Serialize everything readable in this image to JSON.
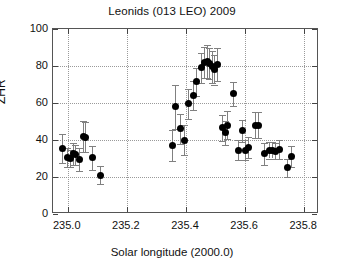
{
  "chart_data": {
    "type": "scatter",
    "title": "Leonids (013 LEO) 2009",
    "xlabel": "Solar longitude (2000.0)",
    "ylabel": "ZHR",
    "xlim": [
      234.95,
      235.85
    ],
    "ylim": [
      0,
      100
    ],
    "xticks": [
      "235.0",
      "235.2",
      "235.4",
      "235.6",
      "235.8"
    ],
    "xtick_values": [
      235.0,
      235.2,
      235.4,
      235.6,
      235.8
    ],
    "yticks": [
      "0",
      "20",
      "40",
      "60",
      "80",
      "100"
    ],
    "ytick_values": [
      0,
      20,
      40,
      60,
      80,
      100
    ],
    "grid": "dotted",
    "legend": "none",
    "series": [
      {
        "name": "ZHR observations",
        "marker": "filled-circle",
        "marker_color": "#000000",
        "errorbar_color": "#808080",
        "points": [
          {
            "x": 234.982,
            "y": 35.5,
            "yerr": 8.0
          },
          {
            "x": 235.0,
            "y": 30.5,
            "yerr": 5.0
          },
          {
            "x": 235.008,
            "y": 30.0,
            "yerr": 4.5
          },
          {
            "x": 235.02,
            "y": 32.5,
            "yerr": 6.0
          },
          {
            "x": 235.027,
            "y": 32.0,
            "yerr": 5.5
          },
          {
            "x": 235.041,
            "y": 29.5,
            "yerr": 6.0
          },
          {
            "x": 235.053,
            "y": 42.0,
            "yerr": 8.5
          },
          {
            "x": 235.059,
            "y": 41.5,
            "yerr": 8.0
          },
          {
            "x": 235.085,
            "y": 30.5,
            "yerr": 6.5
          },
          {
            "x": 235.112,
            "y": 21.0,
            "yerr": 5.0
          },
          {
            "x": 235.355,
            "y": 37.0,
            "yerr": 8.5
          },
          {
            "x": 235.363,
            "y": 58.0,
            "yerr": 12.0
          },
          {
            "x": 235.381,
            "y": 46.0,
            "yerr": 8.0
          },
          {
            "x": 235.396,
            "y": 40.0,
            "yerr": 8.0
          },
          {
            "x": 235.409,
            "y": 59.5,
            "yerr": 8.0
          },
          {
            "x": 235.424,
            "y": 64.0,
            "yerr": 8.0
          },
          {
            "x": 235.437,
            "y": 71.5,
            "yerr": 7.5
          },
          {
            "x": 235.452,
            "y": 79.0,
            "yerr": 8.0
          },
          {
            "x": 235.463,
            "y": 82.0,
            "yerr": 8.5
          },
          {
            "x": 235.472,
            "y": 82.5,
            "yerr": 9.0
          },
          {
            "x": 235.481,
            "y": 81.5,
            "yerr": 8.5
          },
          {
            "x": 235.49,
            "y": 79.5,
            "yerr": 8.5
          },
          {
            "x": 235.497,
            "y": 78.0,
            "yerr": 8.0
          },
          {
            "x": 235.506,
            "y": 81.0,
            "yerr": 9.0
          },
          {
            "x": 235.523,
            "y": 46.5,
            "yerr": 7.0
          },
          {
            "x": 235.533,
            "y": 44.0,
            "yerr": 6.5
          },
          {
            "x": 235.539,
            "y": 48.0,
            "yerr": 7.5
          },
          {
            "x": 235.562,
            "y": 65.0,
            "yerr": 6.5
          },
          {
            "x": 235.576,
            "y": 34.5,
            "yerr": 5.5
          },
          {
            "x": 235.592,
            "y": 45.0,
            "yerr": 6.0
          },
          {
            "x": 235.602,
            "y": 34.5,
            "yerr": 5.5
          },
          {
            "x": 235.612,
            "y": 36.0,
            "yerr": 5.5
          },
          {
            "x": 235.636,
            "y": 48.0,
            "yerr": 7.0
          },
          {
            "x": 235.644,
            "y": 48.0,
            "yerr": 7.0
          },
          {
            "x": 235.666,
            "y": 32.5,
            "yerr": 6.0
          },
          {
            "x": 235.684,
            "y": 34.5,
            "yerr": 4.5
          },
          {
            "x": 235.692,
            "y": 34.5,
            "yerr": 4.5
          },
          {
            "x": 235.702,
            "y": 34.0,
            "yerr": 4.5
          },
          {
            "x": 235.715,
            "y": 35.0,
            "yerr": 5.0
          },
          {
            "x": 235.742,
            "y": 25.0,
            "yerr": 5.0
          },
          {
            "x": 235.757,
            "y": 31.0,
            "yerr": 5.5
          }
        ]
      }
    ]
  }
}
